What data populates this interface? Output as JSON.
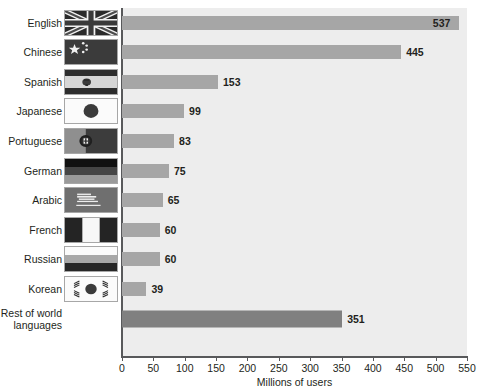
{
  "chart_data": {
    "type": "bar",
    "orientation": "horizontal",
    "title": "",
    "xlabel": "Millions of users",
    "ylabel": "",
    "xlim": [
      0,
      550
    ],
    "xticks": [
      0,
      50,
      100,
      150,
      200,
      250,
      300,
      350,
      400,
      450,
      500,
      550
    ],
    "grid": false,
    "legend": "none",
    "categories": [
      "English",
      "Chinese",
      "Spanish",
      "Japanese",
      "Portuguese",
      "German",
      "Arabic",
      "French",
      "Russian",
      "Korean",
      "Rest of world\nlanguages"
    ],
    "values": [
      537,
      445,
      153,
      99,
      83,
      75,
      65,
      60,
      60,
      39,
      351
    ],
    "value_labels": [
      "537",
      "445",
      "153",
      "99",
      "83",
      "75",
      "65",
      "60",
      "60",
      "39",
      "351"
    ],
    "tick_labels": [
      "0",
      "50",
      "100",
      "150",
      "200",
      "250",
      "300",
      "350",
      "400",
      "450",
      "500",
      "550"
    ],
    "bar_color": "#a6a6a6",
    "rest_bar_color": "#808080",
    "plot_background": "#ededed",
    "axis_color": "#58595b",
    "text_color": "#231f20"
  },
  "rows": [
    {
      "label": "English",
      "value": 537,
      "value_label": "537",
      "flag": "flag-uk",
      "inside": true
    },
    {
      "label": "Chinese",
      "value": 445,
      "value_label": "445",
      "flag": "flag-china",
      "inside": false
    },
    {
      "label": "Spanish",
      "value": 153,
      "value_label": "153",
      "flag": "flag-spain",
      "inside": false
    },
    {
      "label": "Japanese",
      "value": 99,
      "value_label": "99",
      "flag": "flag-japan",
      "inside": false
    },
    {
      "label": "Portuguese",
      "value": 83,
      "value_label": "83",
      "flag": "flag-portugal",
      "inside": false
    },
    {
      "label": "German",
      "value": 75,
      "value_label": "75",
      "flag": "flag-germany",
      "inside": false
    },
    {
      "label": "Arabic",
      "value": 65,
      "value_label": "65",
      "flag": "flag-egypt",
      "inside": false
    },
    {
      "label": "French",
      "value": 60,
      "value_label": "60",
      "flag": "flag-france",
      "inside": false
    },
    {
      "label": "Russian",
      "value": 60,
      "value_label": "60",
      "flag": "flag-russia",
      "inside": false
    },
    {
      "label": "Korean",
      "value": 39,
      "value_label": "39",
      "flag": "flag-korea",
      "inside": false
    },
    {
      "label": "Rest of world\nlanguages",
      "value": 351,
      "value_label": "351",
      "flag": "none",
      "inside": false
    }
  ],
  "axis": {
    "x_title": "Millions of users",
    "ticks": [
      "0",
      "50",
      "100",
      "150",
      "200",
      "250",
      "300",
      "350",
      "400",
      "450",
      "500",
      "550"
    ]
  }
}
